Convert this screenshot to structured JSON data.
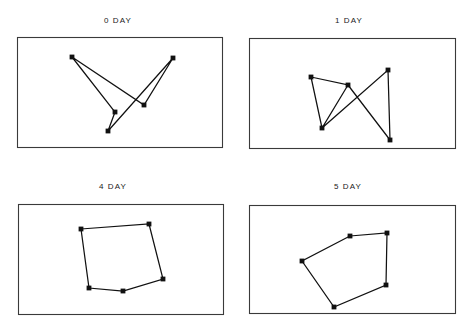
{
  "figure": {
    "background_color": "#ffffff",
    "line_color": "#111111",
    "frame_color": "#3a3a3a",
    "marker_color": "#111111",
    "width": 471,
    "height": 327
  },
  "panels": [
    {
      "title": "0 DAY",
      "title_x": 118,
      "title_y": 16,
      "frame": {
        "x": 17,
        "y": 37,
        "w": 205,
        "h": 110
      },
      "points": [
        {
          "x": 72,
          "y": 57
        },
        {
          "x": 108,
          "y": 131
        },
        {
          "x": 173,
          "y": 58
        },
        {
          "x": 144,
          "y": 105
        },
        {
          "x": 115,
          "y": 112
        }
      ],
      "path_order": [
        0,
        4,
        1,
        2,
        3,
        0
      ]
    },
    {
      "title": "1 DAY",
      "title_x": 349,
      "title_y": 16,
      "frame": {
        "x": 249,
        "y": 38,
        "w": 206,
        "h": 110
      },
      "points": [
        {
          "x": 311,
          "y": 77
        },
        {
          "x": 348,
          "y": 85
        },
        {
          "x": 322,
          "y": 128
        },
        {
          "x": 388,
          "y": 70
        },
        {
          "x": 390,
          "y": 140
        }
      ],
      "path_order": [
        0,
        1,
        2,
        0,
        2,
        3,
        4,
        1
      ]
    },
    {
      "title": "4 DAY",
      "title_x": 113,
      "title_y": 182,
      "frame": {
        "x": 18,
        "y": 204,
        "w": 205,
        "h": 110
      },
      "points": [
        {
          "x": 81,
          "y": 229
        },
        {
          "x": 149,
          "y": 224
        },
        {
          "x": 163,
          "y": 279
        },
        {
          "x": 123,
          "y": 291
        },
        {
          "x": 89,
          "y": 288
        }
      ],
      "path_order": [
        0,
        1,
        2,
        3,
        4,
        0
      ]
    },
    {
      "title": "5 DAY",
      "title_x": 348,
      "title_y": 182,
      "frame": {
        "x": 249,
        "y": 205,
        "w": 206,
        "h": 108
      },
      "points": [
        {
          "x": 350,
          "y": 236
        },
        {
          "x": 387,
          "y": 233
        },
        {
          "x": 386,
          "y": 285
        },
        {
          "x": 334,
          "y": 307
        },
        {
          "x": 302,
          "y": 261
        }
      ],
      "path_order": [
        0,
        1,
        2,
        3,
        4,
        0
      ]
    }
  ],
  "chart_data": {
    "type": "scatter",
    "title": "",
    "subtitle": "",
    "xlabel": "",
    "ylabel": "",
    "grid": false,
    "legend": false,
    "panels": [
      {
        "label": "0 DAY",
        "marker_count": 5,
        "markers": [
          [
            72,
            57
          ],
          [
            108,
            131
          ],
          [
            173,
            58
          ],
          [
            144,
            105
          ],
          [
            115,
            112
          ]
        ],
        "connections": [
          [
            0,
            4
          ],
          [
            4,
            1
          ],
          [
            1,
            2
          ],
          [
            2,
            3
          ],
          [
            3,
            0
          ]
        ],
        "shape": "self-intersecting open polyline (star-like crossing)"
      },
      {
        "label": "1 DAY",
        "marker_count": 5,
        "markers": [
          [
            311,
            77
          ],
          [
            348,
            85
          ],
          [
            322,
            128
          ],
          [
            388,
            70
          ],
          [
            390,
            140
          ]
        ],
        "connections": [
          [
            0,
            1
          ],
          [
            1,
            2
          ],
          [
            2,
            0
          ],
          [
            2,
            3
          ],
          [
            3,
            4
          ],
          [
            4,
            1
          ]
        ],
        "shape": "triangle with crossing X arms"
      },
      {
        "label": "4 DAY",
        "marker_count": 5,
        "markers": [
          [
            81,
            229
          ],
          [
            149,
            224
          ],
          [
            163,
            279
          ],
          [
            123,
            291
          ],
          [
            89,
            288
          ]
        ],
        "connections": [
          [
            0,
            1
          ],
          [
            1,
            2
          ],
          [
            2,
            3
          ],
          [
            3,
            4
          ],
          [
            4,
            0
          ]
        ],
        "shape": "closed convex pentagon"
      },
      {
        "label": "5 DAY",
        "marker_count": 5,
        "markers": [
          [
            350,
            236
          ],
          [
            387,
            233
          ],
          [
            386,
            285
          ],
          [
            334,
            307
          ],
          [
            302,
            261
          ]
        ],
        "connections": [
          [
            0,
            1
          ],
          [
            1,
            2
          ],
          [
            2,
            3
          ],
          [
            3,
            4
          ],
          [
            4,
            0
          ]
        ],
        "shape": "closed convex pentagon"
      }
    ]
  }
}
